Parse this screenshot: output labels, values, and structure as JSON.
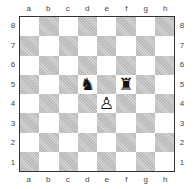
{
  "files": [
    "a",
    "b",
    "c",
    "d",
    "e",
    "f",
    "g",
    "h"
  ],
  "ranks": [
    "8",
    "7",
    "6",
    "5",
    "4",
    "3",
    "2",
    "1"
  ],
  "pieces": {
    "d5": {
      "glyph": "♞",
      "color": "black",
      "type": "knight"
    },
    "f5": {
      "glyph": "♜",
      "color": "black",
      "type": "rook"
    },
    "e4": {
      "glyph": "♙",
      "color": "white",
      "type": "pawn"
    }
  }
}
